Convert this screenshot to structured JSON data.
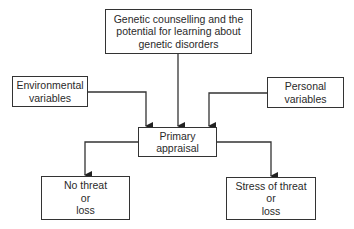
{
  "diagram": {
    "nodes": {
      "top": {
        "lines": [
          "Genetic counselling and the",
          "potential for learning about",
          "genetic disorders"
        ]
      },
      "environmental": {
        "lines": [
          "Environmental",
          "variables"
        ]
      },
      "personal": {
        "lines": [
          "Personal",
          "variables"
        ]
      },
      "primary": {
        "lines": [
          "Primary",
          "appraisal"
        ]
      },
      "no_threat": {
        "lines": [
          "No threat",
          "or",
          "loss"
        ]
      },
      "stress": {
        "lines": [
          "Stress of threat",
          "or",
          "loss"
        ]
      }
    },
    "edges": [
      {
        "from": "top",
        "to": "primary"
      },
      {
        "from": "environmental",
        "to": "primary"
      },
      {
        "from": "personal",
        "to": "primary"
      },
      {
        "from": "primary",
        "to": "no_threat"
      },
      {
        "from": "primary",
        "to": "stress"
      }
    ],
    "colors": {
      "line": "#333333",
      "text": "#2a2a2a",
      "background": "#ffffff"
    }
  }
}
